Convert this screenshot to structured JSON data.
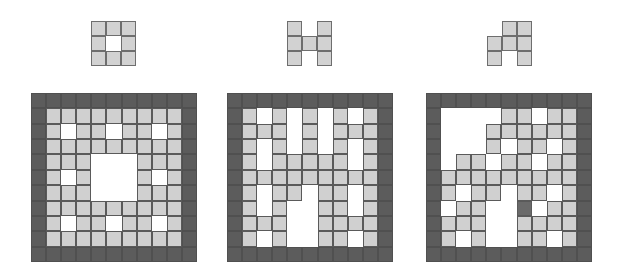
{
  "colors": {
    "border_cell": "#5c5c5c",
    "filled_cell": "#d0d0d0",
    "empty_cell": "#ffffff",
    "marked_cell": "#6a6a6a",
    "grid_line": "#5a5a5a"
  },
  "panels": [
    {
      "name": "panel-1",
      "pattern": [
        "111",
        "101",
        "111"
      ],
      "grid": [
        "111111111",
        "101101101",
        "111111111",
        "111000111",
        "101000101",
        "111000111",
        "111111111",
        "101101101",
        "111111111"
      ]
    },
    {
      "name": "panel-2",
      "pattern": [
        "101",
        "111",
        "101"
      ],
      "grid": [
        "101010101",
        "111010111",
        "101010101",
        "101111101",
        "111111111",
        "101101101",
        "101001101",
        "111001111",
        "101001101"
      ]
    },
    {
      "name": "panel-3",
      "pattern": [
        "011",
        "111",
        "101"
      ],
      "grid": [
        "000011011",
        "000111111",
        "000101101",
        "011011011",
        "111111111",
        "101101101",
        "011002011",
        "111001111",
        "101001101"
      ]
    }
  ],
  "legend": {
    "0": "empty",
    "1": "filled",
    "2": "marked"
  }
}
